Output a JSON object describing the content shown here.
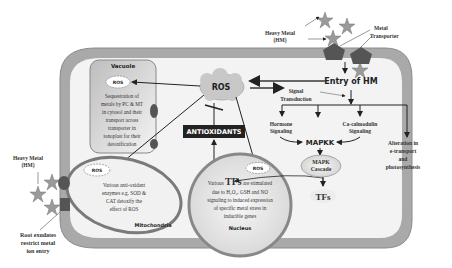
{
  "labels": {
    "heavy_metal_top": [
      "Heavy Metal",
      "(HM)"
    ],
    "metal_transporter": [
      "Metal",
      "Transporter"
    ],
    "entry_of_hm": "Entry of HM",
    "signal_transduction": [
      "Signal",
      "Transduction"
    ],
    "ros_main": "ROS",
    "antioxidants": "ANTIOXIDANTS",
    "hormone_signaling": [
      "Hormone",
      "Signaling"
    ],
    "ca_calmodulin_signaling": [
      "Ca-calmodulin",
      "Signaling"
    ],
    "mapkk": "MAPKK",
    "mapk_cascade": [
      "MAPK",
      "Cascade"
    ],
    "tfs": "TFs",
    "alteration": [
      "Alteration in",
      "e-transport",
      "and",
      "photosynthesis"
    ],
    "heavy_metal_left": [
      "Heavy Metal",
      "(HM)"
    ],
    "root_exudates": [
      "Root exudates",
      "restrict  metal",
      "ion entry"
    ]
  },
  "vacuole": {
    "title": "Vacuole",
    "ros": "ROS",
    "text": [
      "Sequestration of",
      "metals by PC & MT",
      "in cytosol and their",
      "transport across",
      "transporter in",
      "tonoplast for their",
      "detoxification"
    ]
  },
  "mitochondria": {
    "title": "Mitochondria",
    "ros": "ROS",
    "text": [
      "Various anti-oxidant",
      "enzymes e.g. SOD &",
      "CAT detoxify the",
      "effect of ROS"
    ]
  },
  "nucleus": {
    "title": "Nucleus",
    "ros": "ROS",
    "text_lead": "Various ",
    "text_tfs": "TFs",
    "text_tail": " are stimulated",
    "text": [
      "due to H₂O₂, GSH and NO",
      "signaling  to induced expression",
      "of specific metal stress in",
      "inducible  genes"
    ]
  },
  "colors": {
    "cell_wall": "#a9a9a9",
    "cytoplasm": "#f3f3f3",
    "ros_cloud": "#c8c8c8",
    "organelle_outline": "#7a7a7a",
    "transporter": "#555555",
    "star": "#9a9a9a",
    "antioxidants_bg": "#222222"
  }
}
